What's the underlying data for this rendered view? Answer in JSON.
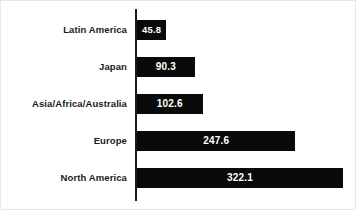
{
  "chart_data": {
    "type": "bar",
    "orientation": "horizontal",
    "title": "",
    "subtitle": "",
    "xlabel": "",
    "ylabel": "",
    "categories": [
      "Latin America",
      "Japan",
      "Asia/Africa/Australia",
      "Europe",
      "North America"
    ],
    "values": [
      45.8,
      90.3,
      102.6,
      247.6,
      322.1
    ],
    "value_labels": [
      "45.8",
      "90.3",
      "102.6",
      "247.6",
      "322.1"
    ],
    "series": [
      {
        "name": "",
        "values": [
          45.8,
          90.3,
          102.6,
          247.6,
          322.1
        ]
      }
    ],
    "xlim": [
      0,
      322.1
    ],
    "grid": false,
    "legend": false,
    "legend_position": "none",
    "tick_labels": [],
    "annotations": [],
    "bar_color": "#0a0a0a",
    "value_text_color": "#ffffff",
    "category_text_color": "#1a1a1a",
    "background_color": "#ffffff",
    "axis_color": "#1a1a1a"
  },
  "rows": [
    {
      "category": "Latin America",
      "value_label": "45.8",
      "value": 45.8
    },
    {
      "category": "Japan",
      "value_label": "90.3",
      "value": 90.3
    },
    {
      "category": "Asia/Africa/Australia",
      "value_label": "102.6",
      "value": 102.6
    },
    {
      "category": "Europe",
      "value_label": "247.6",
      "value": 247.6
    },
    {
      "category": "North America",
      "value_label": "322.1",
      "value": 322.1
    }
  ]
}
